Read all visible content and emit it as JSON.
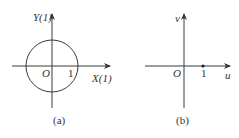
{
  "panels": [
    {
      "id": "a",
      "caption": "(a)",
      "x_axis_label": "X(1)",
      "y_axis_label": "Y(1)",
      "origin_label": "O",
      "tick_label": "1",
      "shape": "unit circle centered at origin"
    },
    {
      "id": "b",
      "caption": "(b)",
      "x_axis_label": "u",
      "y_axis_label": "v",
      "origin_label": "O",
      "tick_label": "1",
      "shape": "single point at u=1"
    }
  ],
  "colors": {
    "stroke": "#3a3a3a",
    "background": "#ffffff"
  }
}
